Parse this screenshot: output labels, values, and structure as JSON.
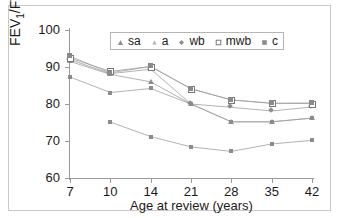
{
  "chart_data": {
    "type": "line",
    "title": "",
    "xlabel": "Age at review (years)",
    "ylabel": "FEV1/FVC",
    "ylabel_parts": {
      "pre": "FEV",
      "sub": "1",
      "post": "/FVC"
    },
    "categories": [
      "7",
      "10",
      "14",
      "21",
      "28",
      "35",
      "42"
    ],
    "x_tick_labels": [
      "7",
      "10",
      "14",
      "21",
      "28",
      "35",
      "42"
    ],
    "y_tick_labels": [
      "100",
      "90",
      "80",
      "70",
      "60"
    ],
    "y_ticks": [
      100,
      90,
      80,
      70,
      60
    ],
    "ylim": [
      60,
      100
    ],
    "grid": false,
    "legend_position": "top-center",
    "series": [
      {
        "name": "sa",
        "marker": "triangle",
        "values": [
          91.5,
          88.0,
          86.0,
          80.0,
          75.2,
          75.2,
          76.2
        ]
      },
      {
        "name": "a",
        "marker": "dot",
        "values": [
          87.3,
          83.1,
          84.2,
          80.0,
          75.2,
          75.2,
          76.2
        ]
      },
      {
        "name": "wb",
        "marker": "diamond",
        "values": [
          92.0,
          88.2,
          89.4,
          80.0,
          79.1,
          78.1,
          79.2
        ]
      },
      {
        "name": "mwb",
        "marker": "open-square",
        "values": [
          92.4,
          88.8,
          90.1,
          84.1,
          81.1,
          80.2,
          80.1
        ]
      },
      {
        "name": "c",
        "marker": "filled-square",
        "values": [
          92.9,
          88.4,
          90.2,
          84.1,
          81.1,
          80.2,
          80.3
        ]
      },
      {
        "name": "low",
        "marker": "dot",
        "values": [
          null,
          75.1,
          71.2,
          68.4,
          67.2,
          69.2,
          70.2
        ]
      }
    ],
    "legend_entries": [
      "sa",
      "a",
      "wb",
      "mwb",
      "c"
    ]
  },
  "legend": {
    "items": [
      {
        "label": "sa"
      },
      {
        "label": "a"
      },
      {
        "label": "wb"
      },
      {
        "label": "mwb"
      },
      {
        "label": "c"
      }
    ]
  },
  "colors": {
    "axis": "#9a9a9a",
    "line": "#a0a0a0",
    "marker": "#8c8c8c",
    "border": "#c9c9c9",
    "background": "#ffffff",
    "text": "#1a1a1a"
  }
}
